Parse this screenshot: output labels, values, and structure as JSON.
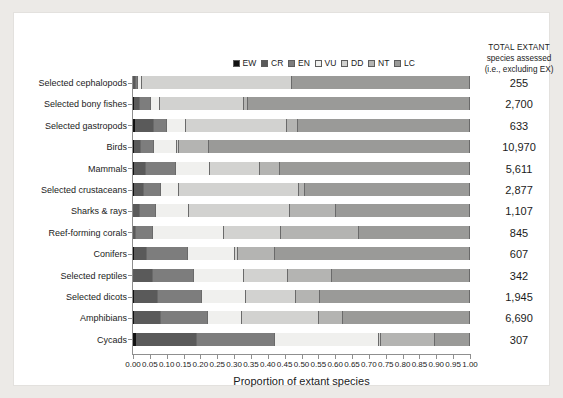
{
  "legend": {
    "items": [
      {
        "code": "EW",
        "color": "#111111"
      },
      {
        "code": "CR",
        "color": "#5a5a5a"
      },
      {
        "code": "EN",
        "color": "#7d7d7d"
      },
      {
        "code": "VU",
        "color": "#f0f0ee"
      },
      {
        "code": "DD",
        "color": "#d2d2d0"
      },
      {
        "code": "NT",
        "color": "#b4b4b2"
      },
      {
        "code": "LC",
        "color": "#9a9a98"
      }
    ]
  },
  "right_header": {
    "line1": "TOTAL EXTANT",
    "line2": "species assessed",
    "line3": "(i.e., excluding EX)"
  },
  "chart_data": {
    "type": "bar",
    "orientation": "horizontal",
    "stacked": true,
    "normalized": true,
    "title": "",
    "xlabel": "Proportion of extant species",
    "ylabel": "",
    "xlim": [
      0,
      1
    ],
    "xticks": [
      "0.00",
      "0.05",
      "0.10",
      "0.15",
      "0.20",
      "0.25",
      "0.30",
      "0.35",
      "0.40",
      "0.45",
      "0.50",
      "0.55",
      "0.60",
      "0.65",
      "0.70",
      "0.75",
      "0.80",
      "0.85",
      "0.90",
      "0.95",
      "1.00"
    ],
    "grid": false,
    "legend_position": "top-center",
    "series": [
      {
        "name": "EW",
        "color": "#111111"
      },
      {
        "name": "CR",
        "color": "#5a5a5a"
      },
      {
        "name": "EN",
        "color": "#7d7d7d"
      },
      {
        "name": "VU",
        "color": "#f0f0ee"
      },
      {
        "name": "DD",
        "color": "#d2d2d0"
      },
      {
        "name": "NT",
        "color": "#b4b4b2"
      },
      {
        "name": "LC",
        "color": "#9a9a98"
      }
    ],
    "categories": [
      "Selected cephalopods",
      "Selected bony fishes",
      "Selected gastropods",
      "Birds",
      "Mammals",
      "Selected crustaceans",
      "Sharks & rays",
      "Reef-forming corals",
      "Conifers",
      "Selected reptiles",
      "Selected dicots",
      "Amphibians",
      "Cycads"
    ],
    "totals": [
      "255",
      "2,700",
      "633",
      "10,970",
      "5,611",
      "2,877",
      "1,107",
      "845",
      "607",
      "342",
      "1,945",
      "6,690",
      "307"
    ],
    "rows": [
      {
        "category": "Selected cephalopods",
        "total": "255",
        "values": {
          "EW": 0.0,
          "CR": 0.008,
          "EN": 0.008,
          "VU": 0.012,
          "DD": 0.445,
          "NT": 0.0,
          "LC": 0.527
        }
      },
      {
        "category": "Selected bony fishes",
        "total": "2,700",
        "values": {
          "EW": 0.004,
          "CR": 0.018,
          "EN": 0.03,
          "VU": 0.028,
          "DD": 0.25,
          "NT": 0.01,
          "LC": 0.66
        }
      },
      {
        "category": "Selected gastropods",
        "total": "633",
        "values": {
          "EW": 0.006,
          "CR": 0.055,
          "EN": 0.04,
          "VU": 0.055,
          "DD": 0.3,
          "NT": 0.035,
          "LC": 0.509
        }
      },
      {
        "category": "Birds",
        "total": "10,970",
        "values": {
          "EW": 0.001,
          "CR": 0.022,
          "EN": 0.036,
          "VU": 0.07,
          "DD": 0.005,
          "NT": 0.09,
          "LC": 0.776
        }
      },
      {
        "category": "Mammals",
        "total": "5,611",
        "values": {
          "EW": 0.001,
          "CR": 0.035,
          "EN": 0.09,
          "VU": 0.1,
          "DD": 0.15,
          "NT": 0.06,
          "LC": 0.564
        }
      },
      {
        "category": "Selected crustaceans",
        "total": "2,877",
        "values": {
          "EW": 0.002,
          "CR": 0.03,
          "EN": 0.05,
          "VU": 0.055,
          "DD": 0.355,
          "NT": 0.018,
          "LC": 0.49
        }
      },
      {
        "category": "Sharks & rays",
        "total": "1,107",
        "values": {
          "EW": 0.0,
          "CR": 0.022,
          "EN": 0.045,
          "VU": 0.1,
          "DD": 0.3,
          "NT": 0.135,
          "LC": 0.398
        }
      },
      {
        "category": "Reef-forming corals",
        "total": "845",
        "values": {
          "EW": 0.0,
          "CR": 0.01,
          "EN": 0.05,
          "VU": 0.21,
          "DD": 0.17,
          "NT": 0.23,
          "LC": 0.33
        }
      },
      {
        "category": "Selected dicots_placeholder",
        "total": "",
        "values": {}
      },
      {
        "category": "Conifers",
        "total": "607",
        "values": {
          "EW": 0.001,
          "CR": 0.04,
          "EN": 0.12,
          "VU": 0.14,
          "DD": 0.01,
          "NT": 0.11,
          "LC": 0.579
        }
      },
      {
        "category": "Selected reptiles",
        "total": "342",
        "values": {
          "EW": 0.0,
          "CR": 0.06,
          "EN": 0.12,
          "VU": 0.15,
          "DD": 0.13,
          "NT": 0.13,
          "LC": 0.41
        }
      },
      {
        "category": "Selected dicots",
        "total": "1,945",
        "values": {
          "EW": 0.004,
          "CR": 0.07,
          "EN": 0.13,
          "VU": 0.13,
          "DD": 0.15,
          "NT": 0.07,
          "LC": 0.446
        }
      },
      {
        "category": "Amphibians",
        "total": "6,690",
        "values": {
          "EW": 0.002,
          "CR": 0.08,
          "EN": 0.14,
          "VU": 0.1,
          "DD": 0.23,
          "NT": 0.07,
          "LC": 0.378
        }
      },
      {
        "category": "Cycads",
        "total": "307",
        "values": {
          "EW": 0.01,
          "CR": 0.18,
          "EN": 0.23,
          "VU": 0.31,
          "DD": 0.005,
          "NT": 0.16,
          "LC": 0.105
        }
      }
    ]
  }
}
